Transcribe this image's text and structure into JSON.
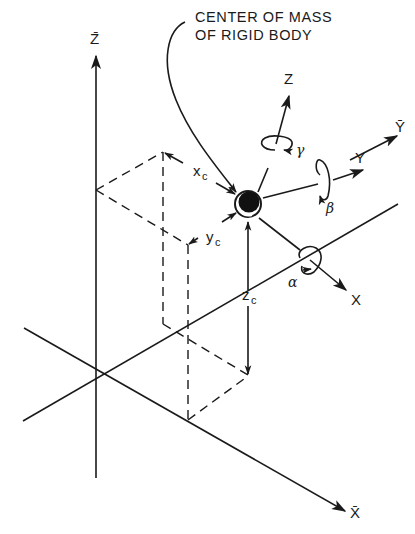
{
  "figure": {
    "caption_lines": [
      "CENTER OF MASS",
      "OF RIGID BODY"
    ],
    "fixed_axes": {
      "x": "X̄",
      "y": "Ȳ",
      "z": "Z̄"
    },
    "body_axes": {
      "x": "X",
      "y": "Y",
      "z": "Z"
    },
    "rotations": {
      "about_x": "α",
      "about_y": "β",
      "about_z": "γ"
    },
    "offsets": {
      "x": "x",
      "x_sub": "c",
      "y": "y",
      "y_sub": "c",
      "z": "z",
      "z_sub": "c"
    },
    "colors": {
      "ink": "#1a1a1a",
      "background": "#ffffff"
    }
  }
}
